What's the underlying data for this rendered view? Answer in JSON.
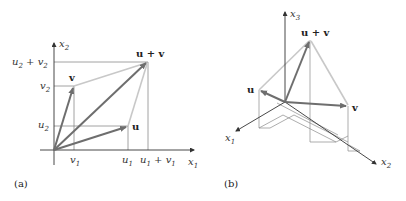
{
  "panel_a": {
    "caption": "(a)",
    "axis_x_label": "x1",
    "axis_y_label": "x2",
    "vectors": [
      {
        "name": "u",
        "label": "u",
        "tip": [
          "u1",
          "u2"
        ]
      },
      {
        "name": "v",
        "label": "v",
        "tip": [
          "v1",
          "v2"
        ]
      },
      {
        "name": "u+v",
        "label": "u + v",
        "tip": [
          "u1 + v1",
          "u2 + v2"
        ]
      }
    ],
    "x_ticks": [
      "v1",
      "u1",
      "u1 + v1"
    ],
    "y_ticks": [
      "u2",
      "v2",
      "u2 + v2"
    ],
    "labels": {
      "x1_base": "x",
      "x1_sub": "1",
      "x2_base": "x",
      "x2_sub": "2",
      "u": "u",
      "v": "v",
      "uv": "u + v",
      "v1_base": "v",
      "v1_sub": "1",
      "u1_base": "u",
      "u1_sub": "1",
      "u1v1_a": "u",
      "u1v1_a_sub": "1",
      "u1v1_plus": " + ",
      "u1v1_b": "v",
      "u1v1_b_sub": "1",
      "u2_base": "u",
      "u2_sub": "2",
      "v2_base": "v",
      "v2_sub": "2",
      "u2v2_a": "u",
      "u2v2_a_sub": "2",
      "u2v2_plus": " + ",
      "u2v2_b": "v",
      "u2v2_b_sub": "2"
    }
  },
  "panel_b": {
    "caption": "(b)",
    "axes": [
      "x1",
      "x2",
      "x3"
    ],
    "vectors": [
      {
        "name": "u",
        "label": "u"
      },
      {
        "name": "v",
        "label": "v"
      },
      {
        "name": "u+v",
        "label": "u + v"
      }
    ],
    "labels": {
      "x1_base": "x",
      "x1_sub": "1",
      "x2_base": "x",
      "x2_sub": "2",
      "x3_base": "x",
      "x3_sub": "3",
      "u": "u",
      "v": "v",
      "uv": "u + v"
    }
  },
  "colors": {
    "vector_dark": "#6e6e6e",
    "parallelogram_light": "#c4c4c4",
    "axis": "#333333",
    "guide": "#888888"
  }
}
